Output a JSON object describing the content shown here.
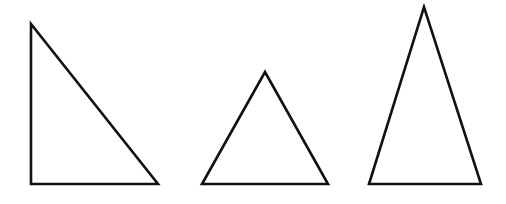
{
  "figure": {
    "background": "#ffffff",
    "stroke_color": "#111111",
    "stroke_width": 2.6,
    "shapes": [
      {
        "name": "right-triangle",
        "type": "triangle",
        "kind": "right",
        "points": "31,24 31,184 158,184"
      },
      {
        "name": "equilateral-triangle",
        "type": "triangle",
        "kind": "equilateral",
        "points": "202,184 265,72 328,184"
      },
      {
        "name": "isosceles-triangle",
        "type": "triangle",
        "kind": "isosceles",
        "points": "369,184 424,7 481,184"
      }
    ]
  }
}
